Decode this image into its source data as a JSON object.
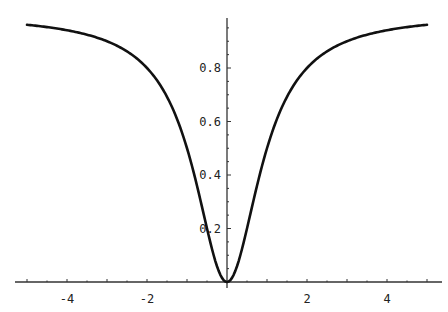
{
  "chart_data": {
    "type": "line",
    "title": "",
    "xlabel": "",
    "ylabel": "",
    "function": "y = x^2 / (1 + x^2)",
    "xlim": [
      -5.3,
      5.3
    ],
    "ylim": [
      0,
      0.99
    ],
    "grid": false,
    "legend": null,
    "x_ticks": [
      -4,
      -2,
      2,
      4
    ],
    "x_tick_labels": [
      "-4",
      "-2",
      "2",
      "4"
    ],
    "x_minor_step": 0.5,
    "y_ticks": [
      0.2,
      0.4,
      0.6,
      0.8
    ],
    "y_tick_labels": [
      "0.2",
      "0.4",
      "0.6",
      "0.8"
    ],
    "y_minor_step": 0.05,
    "series": [
      {
        "name": "curve",
        "color": "#111111",
        "x": [
          -5,
          -4.5,
          -4,
          -3.5,
          -3,
          -2.5,
          -2,
          -1.5,
          -1,
          -0.75,
          -0.5,
          -0.25,
          0,
          0.25,
          0.5,
          0.75,
          1,
          1.5,
          2,
          2.5,
          3,
          3.5,
          4,
          4.5,
          5
        ],
        "y": [
          0.962,
          0.953,
          0.941,
          0.925,
          0.9,
          0.862,
          0.8,
          0.692,
          0.5,
          0.36,
          0.2,
          0.059,
          0,
          0.059,
          0.2,
          0.36,
          0.5,
          0.692,
          0.8,
          0.862,
          0.9,
          0.925,
          0.941,
          0.953,
          0.962
        ]
      }
    ]
  },
  "layout": {
    "origin_px": [
      227,
      282
    ],
    "x_px_per_unit": 40,
    "y_px_per_unit": 267.5,
    "x_axis_px_range": [
      15,
      442
    ],
    "y_axis_px_top": 18
  }
}
